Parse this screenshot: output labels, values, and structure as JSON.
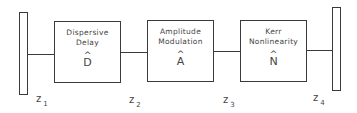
{
  "diagram": {
    "colors": {
      "stroke": "#3a3a3a",
      "text": "#444444",
      "background": "#ffffff"
    },
    "mirrors": [
      {
        "id": "left-mirror"
      },
      {
        "id": "right-mirror"
      }
    ],
    "blocks": [
      {
        "line1": "Dispersive",
        "line2": "Delay",
        "operator": "D",
        "hat": "^"
      },
      {
        "line1": "Amplitude",
        "line2": "Modulation",
        "operator": "A",
        "hat": "^"
      },
      {
        "line1": "Kerr",
        "line2": "Nonlinearity",
        "operator": "N",
        "hat": "^"
      }
    ],
    "positions": [
      {
        "var": "z",
        "sub": "1"
      },
      {
        "var": "z",
        "sub": "2"
      },
      {
        "var": "z",
        "sub": "3"
      },
      {
        "var": "z",
        "sub": "4"
      }
    ]
  }
}
